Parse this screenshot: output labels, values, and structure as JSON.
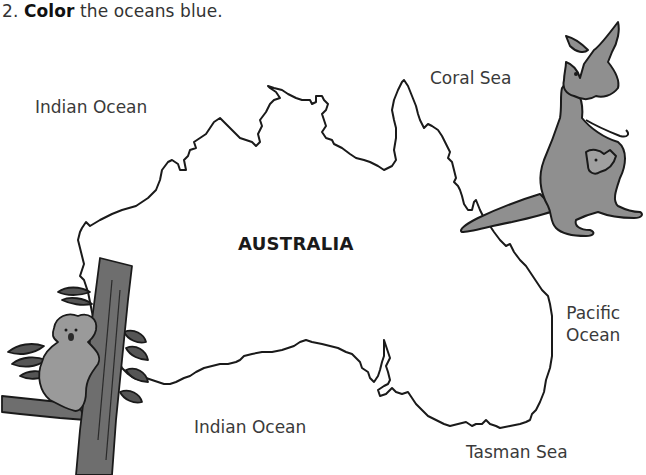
{
  "instruction": {
    "number": "2.",
    "verb": "Color",
    "rest": "the oceans blue."
  },
  "map": {
    "title": "AUSTRALIA",
    "labels": {
      "indian_ocean_top": "Indian Ocean",
      "coral_sea": "Coral Sea",
      "pacific_line1": "Pacific",
      "pacific_line2": "Ocean",
      "indian_ocean_bottom": "Indian Ocean",
      "tasman_sea": "Tasman Sea"
    },
    "illustrations": [
      "kangaroo-with-joey",
      "koala-on-tree"
    ],
    "colors": {
      "outline": "#1a1a1a",
      "animal_fill": "#8f8f8f",
      "tree_fill": "#6e6e6e",
      "leaf_fill": "#555555"
    }
  }
}
